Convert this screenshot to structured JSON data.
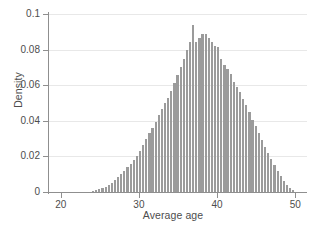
{
  "chart_data": {
    "type": "bar",
    "subtype": "histogram",
    "title": "",
    "xlabel": "Average age",
    "ylabel": "Density",
    "xlim": [
      18.5,
      51.5
    ],
    "ylim": [
      0,
      0.1
    ],
    "xticks": [
      20,
      30,
      40,
      50
    ],
    "xtick_labels": [
      "20",
      "30",
      "40",
      "50"
    ],
    "yticks": [
      0,
      0.02,
      0.04,
      0.06,
      0.08,
      0.1
    ],
    "ytick_labels": [
      "0",
      "0.02",
      "0.04",
      "0.06",
      "0.08",
      "0.1"
    ],
    "grid": "horizontal",
    "legend": "none",
    "bar_color": "#9b9b9b",
    "bin_width": 0.4,
    "categories": [
      24.2,
      24.6,
      25.0,
      25.4,
      25.8,
      26.2,
      26.6,
      27.0,
      27.4,
      27.8,
      28.2,
      28.6,
      29.0,
      29.4,
      29.8,
      30.2,
      30.6,
      31.0,
      31.4,
      31.8,
      32.2,
      32.6,
      33.0,
      33.4,
      33.8,
      34.2,
      34.6,
      35.0,
      35.4,
      35.8,
      36.2,
      36.6,
      37.0,
      37.4,
      37.8,
      38.2,
      38.6,
      39.0,
      39.4,
      39.8,
      40.2,
      40.6,
      41.0,
      41.4,
      41.8,
      42.2,
      42.6,
      43.0,
      43.4,
      43.8,
      44.2,
      44.6,
      45.0,
      45.4,
      45.8,
      46.2,
      46.6,
      47.0,
      47.4,
      47.8,
      48.2,
      48.6,
      49.0,
      49.4,
      49.8
    ],
    "values": [
      0.0008,
      0.0012,
      0.0016,
      0.0022,
      0.003,
      0.004,
      0.0052,
      0.0066,
      0.0082,
      0.01,
      0.012,
      0.014,
      0.016,
      0.0182,
      0.0205,
      0.0232,
      0.0262,
      0.03,
      0.033,
      0.036,
      0.0395,
      0.043,
      0.0465,
      0.05,
      0.053,
      0.057,
      0.0615,
      0.0655,
      0.07,
      0.0745,
      0.08,
      0.0845,
      0.094,
      0.0845,
      0.0865,
      0.089,
      0.0885,
      0.0865,
      0.0845,
      0.082,
      0.0815,
      0.0745,
      0.0715,
      0.069,
      0.0665,
      0.062,
      0.059,
      0.056,
      0.052,
      0.049,
      0.045,
      0.0405,
      0.037,
      0.033,
      0.029,
      0.0255,
      0.022,
      0.0185,
      0.015,
      0.0118,
      0.009,
      0.0062,
      0.004,
      0.0022,
      0.001
    ]
  }
}
